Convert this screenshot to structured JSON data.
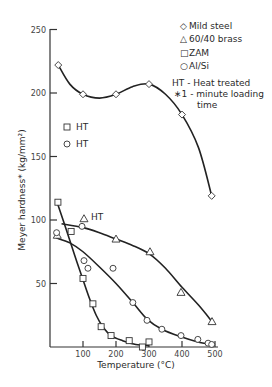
{
  "chart_data": {
    "type": "line",
    "title": "",
    "xlabel": "Temperature (°C)",
    "ylabel": "Meyer hardness* (kg/mm²)",
    "xlim": [
      0,
      520
    ],
    "ylim": [
      0,
      250
    ],
    "x_ticks": [
      100,
      200,
      300,
      400,
      500
    ],
    "y_ticks": [
      50,
      100,
      150,
      200,
      250
    ],
    "grid": false,
    "legend_position": "top-right",
    "legend": [
      {
        "marker": "diamond",
        "symbol": "◇",
        "label": "Mild steel"
      },
      {
        "marker": "triangle",
        "symbol": "△",
        "label": "60/40 brass"
      },
      {
        "marker": "square",
        "symbol": "□",
        "label": "ZAM"
      },
      {
        "marker": "circle",
        "symbol": "○",
        "label": "Al/Si"
      }
    ],
    "notes": [
      "HT - Heat treated",
      "∗1 - minute loading",
      "time"
    ],
    "series": [
      {
        "name": "Mild steel",
        "marker": "diamond",
        "points": [
          [
            25,
            222
          ],
          [
            100,
            199
          ],
          [
            200,
            199
          ],
          [
            300,
            207
          ],
          [
            400,
            183
          ],
          [
            490,
            119
          ]
        ],
        "curve": [
          [
            25,
            222
          ],
          [
            60,
            207
          ],
          [
            100,
            199
          ],
          [
            150,
            196
          ],
          [
            200,
            199
          ],
          [
            250,
            205
          ],
          [
            300,
            207
          ],
          [
            350,
            199
          ],
          [
            400,
            183
          ],
          [
            450,
            157
          ],
          [
            490,
            119
          ]
        ]
      },
      {
        "name": "60/40 brass",
        "marker": "triangle",
        "points": [
          [
            22,
            88
          ],
          [
            200,
            85
          ],
          [
            303,
            75
          ],
          [
            397,
            43
          ],
          [
            491,
            20
          ]
        ],
        "curve": [
          [
            35,
            97
          ],
          [
            100,
            94
          ],
          [
            150,
            90
          ],
          [
            200,
            85
          ],
          [
            250,
            80
          ],
          [
            303,
            73
          ],
          [
            350,
            62
          ],
          [
            400,
            47
          ],
          [
            450,
            33
          ],
          [
            491,
            20
          ]
        ]
      },
      {
        "name": "60/40 brass (HT)",
        "marker": "triangle",
        "points": [
          [
            103,
            101
          ]
        ]
      },
      {
        "name": "ZAM",
        "marker": "square",
        "points": [
          [
            24,
            114
          ],
          [
            64,
            91
          ],
          [
            100,
            54
          ],
          [
            130,
            34
          ],
          [
            155,
            16
          ],
          [
            185,
            9
          ],
          [
            240,
            5
          ],
          [
            280,
            0
          ],
          [
            300,
            4
          ]
        ],
        "curve": [
          [
            24,
            112
          ],
          [
            50,
            92
          ],
          [
            75,
            72
          ],
          [
            100,
            53
          ],
          [
            120,
            38
          ],
          [
            140,
            25
          ],
          [
            160,
            16
          ],
          [
            185,
            9
          ],
          [
            220,
            5
          ],
          [
            260,
            2
          ],
          [
            300,
            1
          ]
        ]
      },
      {
        "name": "ZAM (HT)",
        "marker": "square",
        "points": []
      },
      {
        "name": "Al/Si",
        "marker": "circle",
        "points": [
          [
            20,
            90
          ],
          [
            97,
            95
          ],
          [
            103,
            68
          ],
          [
            115,
            62
          ],
          [
            191,
            62
          ],
          [
            251,
            35
          ],
          [
            294,
            21
          ],
          [
            339,
            14
          ],
          [
            397,
            9
          ],
          [
            448,
            6
          ],
          [
            479,
            3
          ],
          [
            490,
            2
          ]
        ],
        "curve": [
          [
            18,
            86
          ],
          [
            60,
            82
          ],
          [
            100,
            75
          ],
          [
            150,
            63
          ],
          [
            200,
            50
          ],
          [
            251,
            35
          ],
          [
            294,
            22
          ],
          [
            339,
            14
          ],
          [
            397,
            8
          ],
          [
            448,
            4
          ],
          [
            490,
            2
          ]
        ]
      }
    ],
    "annotations": [
      {
        "text": "HT",
        "x": 112,
        "y": 100,
        "note": "label next to HT brass triangle"
      }
    ]
  },
  "legend_panel": {
    "items": [
      {
        "symbol": "◇",
        "label": "Mild steel"
      },
      {
        "symbol": "△",
        "label": "60/40 brass"
      },
      {
        "symbol": "□",
        "label": "ZAM"
      },
      {
        "symbol": "○",
        "label": "Al/Si"
      }
    ],
    "notes": [
      "HT - Heat treated",
      "∗1 - minute loading",
      "time"
    ]
  },
  "inline_keys": [
    {
      "symbol": "□",
      "label": "HT"
    },
    {
      "symbol": "○",
      "label": "HT"
    }
  ],
  "axes": {
    "x_title": "Temperature (°C)",
    "y_title": "Meyer hardness* (kg/mm²)"
  }
}
